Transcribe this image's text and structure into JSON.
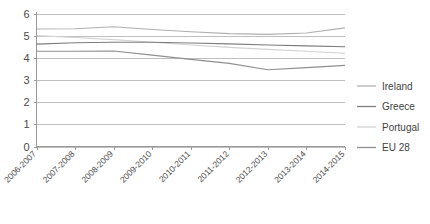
{
  "chart_data": {
    "type": "line",
    "title": "",
    "xlabel": "",
    "ylabel": "",
    "ylim": [
      0,
      6
    ],
    "yticks": [
      0,
      1,
      2,
      3,
      4,
      5,
      6
    ],
    "ytick_labels": [
      "0",
      "1",
      "2",
      "3",
      "4",
      "5",
      "6"
    ],
    "grid": true,
    "legend_position": "right",
    "categories": [
      "2006-2007",
      "2007-2008",
      "2008-2009",
      "2009-2010",
      "2010-2011",
      "2011-2012",
      "2012-2013",
      "2013-2014",
      "2014-2015"
    ],
    "series": [
      {
        "name": "Ireland",
        "color": "#b0b0b0",
        "values": [
          5.3,
          5.31,
          5.4,
          5.28,
          5.18,
          5.09,
          5.06,
          5.12,
          5.35
        ]
      },
      {
        "name": "Greece",
        "color": "#7d7d7d",
        "values": [
          4.62,
          4.68,
          4.7,
          4.7,
          4.67,
          4.63,
          4.58,
          4.54,
          4.5
        ]
      },
      {
        "name": "Portugal",
        "color": "#d2d2d2",
        "values": [
          5.0,
          4.92,
          4.82,
          4.7,
          4.58,
          4.47,
          4.38,
          4.3,
          4.21
        ]
      },
      {
        "name": "EU 28",
        "color": "#8f8f8f",
        "values": [
          4.3,
          4.3,
          4.31,
          4.12,
          3.93,
          3.75,
          3.46,
          3.56,
          3.66
        ]
      }
    ]
  },
  "legend": {
    "items": [
      {
        "label": "Ireland",
        "color": "#b0b0b0"
      },
      {
        "label": "Greece",
        "color": "#7d7d7d"
      },
      {
        "label": "Portugal",
        "color": "#d2d2d2"
      },
      {
        "label": "EU 28",
        "color": "#8f8f8f"
      }
    ]
  },
  "axes": {
    "gridline_color": "#bfbfbf",
    "axis_color": "#9a9a9a",
    "label_color": "#4a4a4a"
  }
}
